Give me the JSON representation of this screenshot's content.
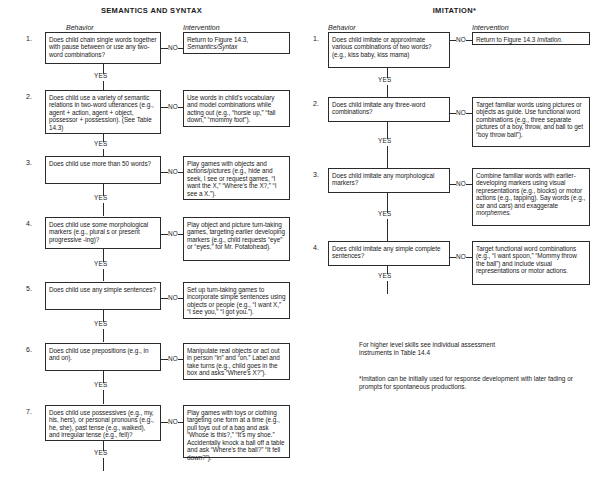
{
  "left_section": {
    "title": "SEMANTICS AND SYNTAX",
    "behavior_header": "Behavior",
    "intervention_header": "Intervention",
    "yes_label": "YES",
    "no_label": "NO",
    "rows": [
      {
        "num": "1.",
        "behavior": "Does child chain single words together with pause between or use any two-word combinations?",
        "intervention_plain": "Return to Figure 14.3,",
        "intervention_italic": "Semantics/Syntax"
      },
      {
        "num": "2.",
        "behavior": "Does child use a variety of semantic relations in two-word utterances (e.g., agent + action, agent + object, possessor + possession). (See Table 14.3)",
        "intervention_plain": "Use words in child's vocabulary and model combinations while acting out (e.g., “horsie up,” “fall down,” “mommy foot”).",
        "intervention_italic": ""
      },
      {
        "num": "3.",
        "behavior": "Does child use more than 50 words?",
        "intervention_plain": "Play games with objects and actions/pictures (e.g., hide and seek, I see or request games, “I want the X,” “Where's the X?,” “I see a X.”).",
        "intervention_italic": ""
      },
      {
        "num": "4.",
        "behavior": "Does child use some morphological markers (e.g., plural s or present progressive -ing)?",
        "intervention_plain": "Play object and picture turn-taking games, targeting earlier developing markers (e.g., child requests “eye” or “eyes,” for Mr. Potatohead).",
        "intervention_italic": ""
      },
      {
        "num": "5.",
        "behavior": "Does child use any simple sentences?",
        "intervention_plain": "Set up turn-taking games to incorporate simple sentences using objects or people (e.g., “I want X,” “I see you,” “I got you.”).",
        "intervention_italic": ""
      },
      {
        "num": "6.",
        "behavior": "Does child use prepositions (e.g., in and on).",
        "intervention_plain": "Manipulate real objects or act out in person “in” and “on.” Label and take turns (e.g., child goes in the box and asks “Where's X?”).",
        "intervention_italic": ""
      },
      {
        "num": "7.",
        "behavior": "Does child use possessives (e.g., my, his, hers), or personal pronouns (e.g., he, she), past tense (e.g., walked), and irregular tense (e.g., fell)?",
        "intervention_plain": "Play games with toys or clothing targeting one form at a time (e.g., pull toys out of a bag and ask “Whose is this?,” “It's my shoe.” Accidentally knock a ball off a table and ask “Where's the ball?” “It fell down?”).",
        "intervention_italic": ""
      }
    ]
  },
  "right_section": {
    "title": "IMITATION*",
    "behavior_header": "Behavior",
    "intervention_header": "Intervention",
    "yes_label": "YES",
    "no_label": "NO",
    "rows": [
      {
        "num": "1.",
        "behavior": "Does child imitate or approximate various combinations of two words? (e.g., kiss baby, kiss mama)",
        "intervention_plain": "Return to Figure 14.3 ",
        "intervention_italic": "Imitation."
      },
      {
        "num": "2.",
        "behavior": "Does child imitate any three-word combinations?",
        "intervention_plain": "Target familiar words using pictures or objects as guide. Use functional word combinations (e.g., three separate pictures of a boy, throw, and ball to get “boy throw ball”).",
        "intervention_italic": ""
      },
      {
        "num": "3.",
        "behavior": "Does child imitate any morphological markers?",
        "intervention_plain": "Combine familiar words with earlier-developing markers using visual representations (e.g., blocks) or motor actions (e.g., tapping). Say words (e.g., car and cars) and exaggerate ",
        "intervention_italic": "morphemes."
      },
      {
        "num": "4.",
        "behavior": "Does child imitate any simple complete sentences?",
        "intervention_plain": "Target functional word combinations (e.g., “I want spoon,” “Mommy throw the ball”) and include visual representations or motor actions.",
        "intervention_italic": ""
      }
    ],
    "note_block": "For higher level skills see individual assessment instruments in Table 14.4",
    "footnote": "*Imitation can be initially used for response development with later fading or prompts for spontaneous productions."
  }
}
